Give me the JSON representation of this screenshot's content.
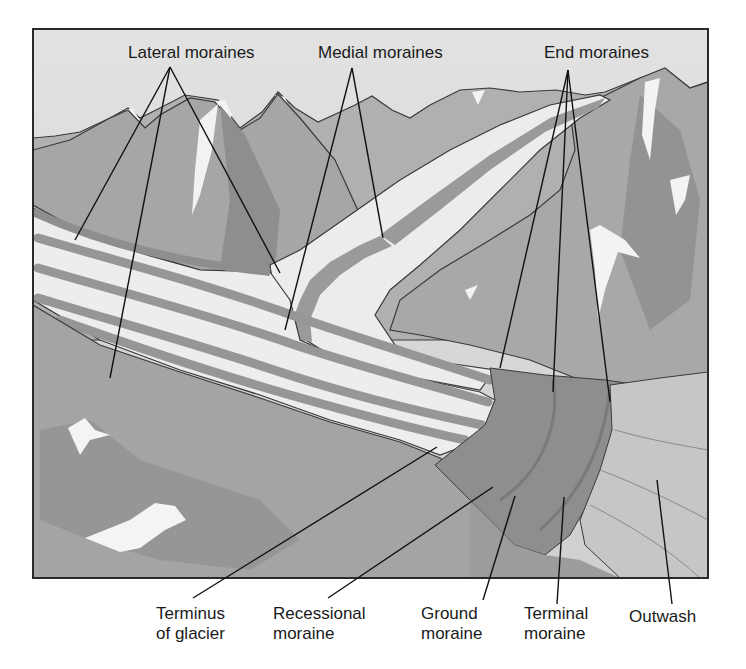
{
  "diagram": {
    "colors": {
      "sky": "#d9d9d9",
      "ice": "#ececec",
      "moraine_band": "#9a9a9a",
      "mountain_light": "#b4b4b4",
      "mountain_mid": "#a0a0a0",
      "mountain_dark": "#8a8a8a",
      "snow": "#f5f5f5",
      "end_moraine_zone": "#8f8f8f",
      "outwash": "#c4c4c4",
      "outline": "#3a3a3a",
      "leader_line": "#111111"
    },
    "top_labels": [
      {
        "id": "lateral",
        "text": "Lateral moraines"
      },
      {
        "id": "medial",
        "text": "Medial moraines"
      },
      {
        "id": "end",
        "text": "End moraines"
      }
    ],
    "bottom_labels": [
      {
        "id": "terminus",
        "line1": "Terminus",
        "line2": "of glacier"
      },
      {
        "id": "recessional",
        "line1": "Recessional",
        "line2": "moraine"
      },
      {
        "id": "ground",
        "line1": "Ground",
        "line2": "moraine"
      },
      {
        "id": "terminal",
        "line1": "Terminal",
        "line2": "moraine"
      },
      {
        "id": "outwash",
        "line1": "Outwash",
        "line2": ""
      }
    ]
  }
}
